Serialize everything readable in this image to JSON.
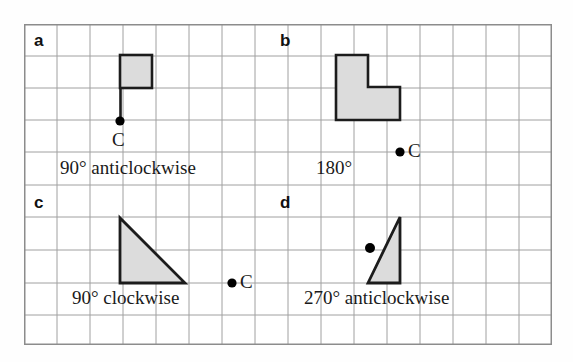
{
  "figure": {
    "type": "rotation-worksheet-grid",
    "grid": {
      "cols": 16,
      "rows": 10,
      "cell_px": 33,
      "line_color": "#9a9a9a",
      "border_color": "#8c8c8c",
      "background": "#ffffff"
    },
    "style": {
      "shape_fill": "#dcdcdc",
      "shape_stroke": "#1c1c1c",
      "dot_color": "#000000",
      "text_color": "#1a1a1a"
    }
  },
  "panels": [
    {
      "letter": "a",
      "caption": "90° anticlockwise",
      "centre_label": "C",
      "shape": "square",
      "shape_points": "96,31 128,31 128,64 96,64",
      "connector": "96,64 96,97",
      "dot": {
        "x": 96,
        "y": 97
      },
      "letter_pos": {
        "x": 10,
        "y": 8
      },
      "caption_pos": {
        "x": 36,
        "y": 138
      },
      "c_pos": {
        "x": 88,
        "y": 108
      }
    },
    {
      "letter": "b",
      "caption": "180°",
      "centre_label": "C",
      "shape": "L-shape",
      "shape_points": "312,31 376,31 376,63 344,63 344,31",
      "shape_points_actual": "312,31 344,31 344,63 376,63 376,96 312,96",
      "dot": {
        "x": 376,
        "y": 128
      },
      "letter_pos": {
        "x": 256,
        "y": 8
      },
      "caption_pos": {
        "x": 292,
        "y": 138
      },
      "c_pos": {
        "x": 384,
        "y": 118
      }
    },
    {
      "letter": "c",
      "caption": "90° clockwise",
      "centre_label": "C",
      "shape": "right-triangle",
      "shape_points": "96,194 96,259 161,259",
      "dot": {
        "x": 208,
        "y": 259
      },
      "letter_pos": {
        "x": 10,
        "y": 170
      },
      "caption_pos": {
        "x": 48,
        "y": 267
      },
      "c_pos": {
        "x": 216,
        "y": 249
      }
    },
    {
      "letter": "d",
      "caption": "270° anticlockwise",
      "centre_label": "",
      "shape": "right-triangle",
      "shape_points": "376,193 376,259 344,259",
      "dot": {
        "x": 346,
        "y": 224
      },
      "letter_pos": {
        "x": 256,
        "y": 170
      },
      "caption_pos": {
        "x": 280,
        "y": 267
      },
      "c_pos": null
    }
  ]
}
